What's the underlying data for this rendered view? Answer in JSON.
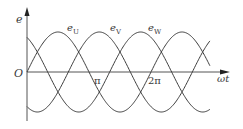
{
  "chart_data": {
    "type": "line",
    "title": "",
    "xlabel": "ωt",
    "ylabel": "e",
    "origin_label": "O",
    "x_ticks": [
      {
        "value": 3.14159,
        "label": "π"
      },
      {
        "value": 6.28319,
        "label": "2π"
      }
    ],
    "x_range": [
      0,
      9.27
    ],
    "y_range": [
      -1,
      1
    ],
    "grid": false,
    "legend": "inline labels above peaks",
    "series": [
      {
        "name": "e_U",
        "label_main": "e",
        "label_sub": "U",
        "function": "sin(ωt)",
        "phase_deg": 0
      },
      {
        "name": "e_V",
        "label_main": "e",
        "label_sub": "V",
        "function": "sin(ωt - 120°)",
        "phase_deg": -120
      },
      {
        "name": "e_W",
        "label_main": "e",
        "label_sub": "W",
        "function": "sin(ωt + 120°)",
        "phase_deg": 120
      }
    ]
  },
  "layout": {
    "origin_x": 27,
    "axis_y": 72,
    "px_per_pi": 62,
    "amplitude_px": 40,
    "theta_max_pi": 2.95,
    "line_color": "#3c3c3c",
    "axis_color": "#555555"
  }
}
